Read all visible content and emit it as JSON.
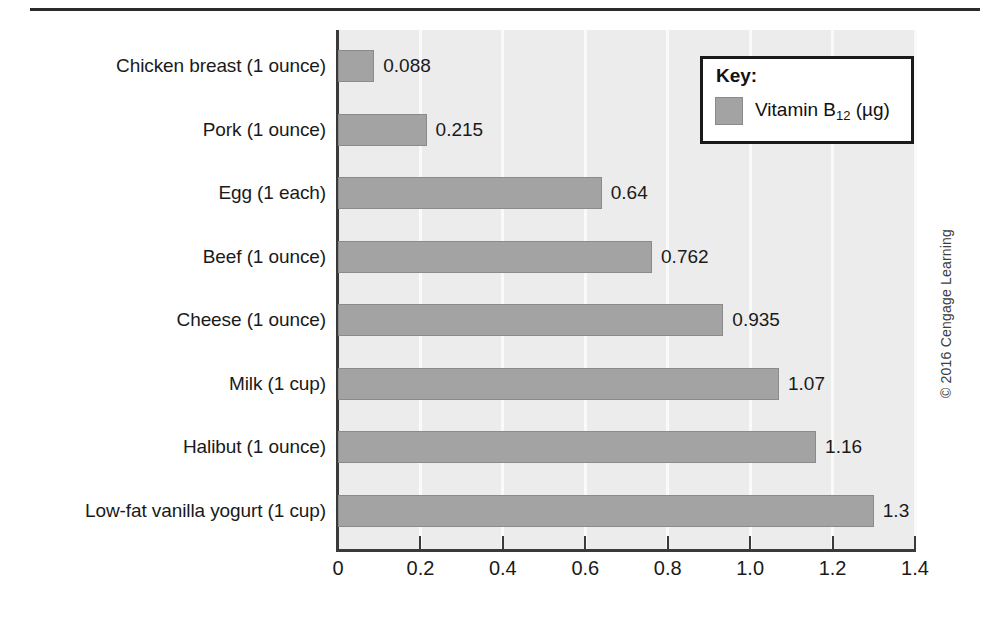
{
  "chart_data": {
    "type": "bar",
    "orientation": "horizontal",
    "title": "",
    "xlabel": "",
    "ylabel": "",
    "xlim": [
      0,
      1.4
    ],
    "xticks": [
      "0",
      "0.2",
      "0.4",
      "0.6",
      "0.8",
      "1.0",
      "1.2",
      "1.4"
    ],
    "xtick_values": [
      0,
      0.2,
      0.4,
      0.6,
      0.8,
      1.0,
      1.2,
      1.4
    ],
    "grid": "vertical-white-gridlines",
    "legend_position": "top-right",
    "categories": [
      "Chicken breast (1 ounce)",
      "Pork (1 ounce)",
      "Egg (1 each)",
      "Beef (1 ounce)",
      "Cheese (1 ounce)",
      "Milk (1 cup)",
      "Halibut (1 ounce)",
      "Low-fat vanilla yogurt (1 cup)"
    ],
    "values": [
      0.088,
      0.215,
      0.64,
      0.762,
      0.935,
      1.07,
      1.16,
      1.3
    ],
    "value_labels": [
      "0.088",
      "0.215",
      "0.64",
      "0.762",
      "0.935",
      "1.07",
      "1.16",
      "1.3"
    ],
    "series": [
      {
        "name": "Vitamin B12 (µg)",
        "values": [
          0.088,
          0.215,
          0.64,
          0.762,
          0.935,
          1.07,
          1.16,
          1.3
        ]
      }
    ]
  },
  "legend": {
    "title": "Key:",
    "series_name_prefix": "Vitamin B",
    "series_name_subscript": "12",
    "series_name_suffix": " (µg)"
  },
  "colors": {
    "bar_fill": "#a3a3a3",
    "bar_border": "#8a8a8a",
    "plot_background": "#ececec",
    "gridline": "#fafafa",
    "axis": "#3a3a3a",
    "text": "#1a1a1a",
    "legend_background": "#ffffff",
    "legend_border": "#1a1a1a"
  },
  "footer": {
    "copyright": "© 2016 Cengage Learning"
  }
}
